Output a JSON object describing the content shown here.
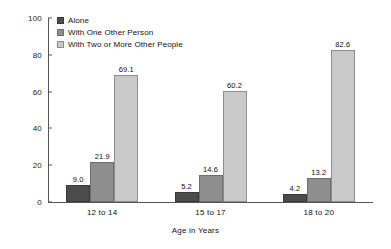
{
  "chart_data": {
    "type": "bar",
    "title": "",
    "xlabel": "Age in Years",
    "ylabel": "Percent",
    "ylim": [
      0,
      100
    ],
    "yticks": [
      0,
      20,
      40,
      60,
      80,
      100
    ],
    "ytick_labels": [
      "0",
      "20",
      "40",
      "60",
      "80",
      "100"
    ],
    "grid": false,
    "legend_position": "top-left",
    "categories": [
      "12 to 14",
      "15 to 17",
      "18 to 20"
    ],
    "series": [
      {
        "name": "Alone",
        "color": "#4c4c4c",
        "values": [
          9.0,
          5.2,
          4.2
        ],
        "labels": [
          "9.0",
          "5.2",
          "4.2"
        ]
      },
      {
        "name": "With One Other Person",
        "color": "#8e8e8e",
        "values": [
          21.9,
          14.6,
          13.2
        ],
        "labels": [
          "21.9",
          "14.6",
          "13.2"
        ]
      },
      {
        "name": "With Two or More Other People",
        "color": "#c9c9c9",
        "values": [
          69.1,
          60.2,
          82.6
        ],
        "labels": [
          "69.1",
          "60.2",
          "82.6"
        ]
      }
    ]
  }
}
